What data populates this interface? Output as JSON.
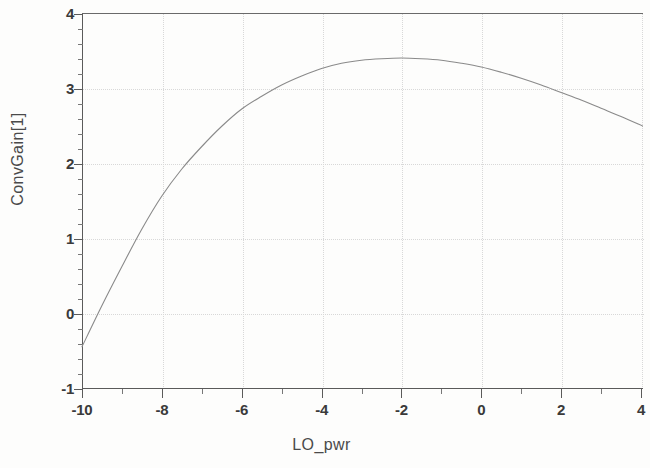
{
  "chart_data": {
    "type": "line",
    "title": "",
    "xlabel": "LO_pwr",
    "ylabel": "ConvGain[1]",
    "xlim": [
      -10,
      4.05
    ],
    "ylim": [
      -1,
      4
    ],
    "grid": true,
    "legend": false,
    "x_ticks": [
      -10,
      -8,
      -6,
      -4,
      -2,
      0,
      2,
      4
    ],
    "x_tick_labels": [
      "-10",
      "-8",
      "-6",
      "-4",
      "-2",
      "0",
      "2",
      "4"
    ],
    "x_minor_ticks": [
      -9,
      -7,
      -5,
      -3,
      -1,
      1,
      3
    ],
    "y_ticks": [
      -1,
      0,
      1,
      2,
      3,
      4
    ],
    "y_tick_labels": [
      "-1",
      "0",
      "1",
      "2",
      "3",
      "4"
    ],
    "y_minor_interval": 0.2,
    "series": [
      {
        "name": "ConvGain[1]",
        "color": "#8a8a8a",
        "x": [
          -10.0,
          -9.5,
          -9.0,
          -8.5,
          -8.0,
          -7.5,
          -7.0,
          -6.5,
          -6.0,
          -5.5,
          -5.0,
          -4.5,
          -4.0,
          -3.5,
          -3.0,
          -2.5,
          -2.0,
          -1.5,
          -1.0,
          -0.5,
          0.0,
          0.5,
          1.0,
          1.5,
          2.0,
          2.5,
          3.0,
          3.5,
          4.05
        ],
        "y": [
          -0.45,
          0.1,
          0.62,
          1.12,
          1.56,
          1.92,
          2.22,
          2.49,
          2.72,
          2.89,
          3.04,
          3.16,
          3.26,
          3.33,
          3.37,
          3.39,
          3.4,
          3.39,
          3.37,
          3.33,
          3.28,
          3.21,
          3.13,
          3.04,
          2.94,
          2.84,
          2.73,
          2.62,
          2.49
        ]
      }
    ]
  },
  "axis_titles": {
    "x": "LO_pwr",
    "y": "ConvGain[1]"
  }
}
